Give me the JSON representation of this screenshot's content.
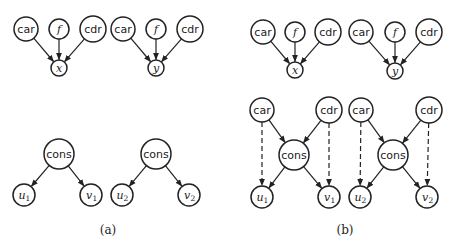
{
  "figure": {
    "panels": [
      {
        "id": "a",
        "caption": "(a)",
        "caption_pos": [
          108,
          234
        ],
        "nodes": [
          {
            "id": "a_car1",
            "label": "car",
            "style": "sans",
            "x": 26,
            "y": 29,
            "r": 12
          },
          {
            "id": "a_f1",
            "label": "f",
            "style": "math",
            "x": 59,
            "y": 29,
            "r": 10
          },
          {
            "id": "a_cdr1",
            "label": "cdr",
            "style": "sans",
            "x": 93,
            "y": 29,
            "r": 13
          },
          {
            "id": "a_x",
            "label": "x",
            "style": "math",
            "x": 59,
            "y": 68,
            "r": 8
          },
          {
            "id": "a_car2",
            "label": "car",
            "style": "sans",
            "x": 123,
            "y": 29,
            "r": 12
          },
          {
            "id": "a_f2",
            "label": "f",
            "style": "math",
            "x": 156,
            "y": 29,
            "r": 10
          },
          {
            "id": "a_cdr2",
            "label": "cdr",
            "style": "sans",
            "x": 190,
            "y": 29,
            "r": 13
          },
          {
            "id": "a_y",
            "label": "y",
            "style": "math",
            "x": 156,
            "y": 68,
            "r": 8
          },
          {
            "id": "a_cons1",
            "label": "cons",
            "style": "sans",
            "x": 59,
            "y": 154,
            "r": 15
          },
          {
            "id": "a_u1",
            "label": "u",
            "sub": "1",
            "style": "math",
            "x": 24,
            "y": 195,
            "r": 11
          },
          {
            "id": "a_v1",
            "label": "v",
            "sub": "1",
            "style": "math",
            "x": 91,
            "y": 195,
            "r": 11
          },
          {
            "id": "a_cons2",
            "label": "cons",
            "style": "sans",
            "x": 156,
            "y": 154,
            "r": 15
          },
          {
            "id": "a_u2",
            "label": "u",
            "sub": "2",
            "style": "math",
            "x": 122,
            "y": 195,
            "r": 11
          },
          {
            "id": "a_v2",
            "label": "v",
            "sub": "2",
            "style": "math",
            "x": 189,
            "y": 195,
            "r": 11
          }
        ],
        "edges": [
          {
            "from": "a_car1",
            "to": "a_x",
            "style": "solid"
          },
          {
            "from": "a_f1",
            "to": "a_x",
            "style": "solid"
          },
          {
            "from": "a_cdr1",
            "to": "a_x",
            "style": "solid"
          },
          {
            "from": "a_car2",
            "to": "a_y",
            "style": "solid"
          },
          {
            "from": "a_f2",
            "to": "a_y",
            "style": "solid"
          },
          {
            "from": "a_cdr2",
            "to": "a_y",
            "style": "solid"
          },
          {
            "from": "a_cons1",
            "to": "a_u1",
            "style": "solid"
          },
          {
            "from": "a_cons1",
            "to": "a_v1",
            "style": "solid"
          },
          {
            "from": "a_cons2",
            "to": "a_u2",
            "style": "solid"
          },
          {
            "from": "a_cons2",
            "to": "a_v2",
            "style": "solid"
          }
        ]
      },
      {
        "id": "b",
        "caption": "(b)",
        "caption_pos": [
          345,
          234
        ],
        "nodes": [
          {
            "id": "b_car1",
            "label": "car",
            "style": "sans",
            "x": 263,
            "y": 32,
            "r": 12
          },
          {
            "id": "b_f1",
            "label": "f",
            "style": "math",
            "x": 295,
            "y": 32,
            "r": 10
          },
          {
            "id": "b_cdr1",
            "label": "cdr",
            "style": "sans",
            "x": 328,
            "y": 32,
            "r": 13
          },
          {
            "id": "b_x",
            "label": "x",
            "style": "math",
            "x": 295,
            "y": 70,
            "r": 8
          },
          {
            "id": "b_car2",
            "label": "car",
            "style": "sans",
            "x": 361,
            "y": 32,
            "r": 12
          },
          {
            "id": "b_f2",
            "label": "f",
            "style": "math",
            "x": 395,
            "y": 32,
            "r": 10
          },
          {
            "id": "b_cdr2",
            "label": "cdr",
            "style": "sans",
            "x": 429,
            "y": 32,
            "r": 13
          },
          {
            "id": "b_y",
            "label": "y",
            "style": "math",
            "x": 395,
            "y": 71,
            "r": 8
          },
          {
            "id": "b_car3",
            "label": "car",
            "style": "sans",
            "x": 262,
            "y": 110,
            "r": 12
          },
          {
            "id": "b_cdr3",
            "label": "cdr",
            "style": "sans",
            "x": 329,
            "y": 110,
            "r": 13
          },
          {
            "id": "b_cons1",
            "label": "cons",
            "style": "sans",
            "x": 294,
            "y": 155,
            "r": 15
          },
          {
            "id": "b_u1",
            "label": "u",
            "sub": "1",
            "style": "math",
            "x": 262,
            "y": 197,
            "r": 11
          },
          {
            "id": "b_v1",
            "label": "v",
            "sub": "1",
            "style": "math",
            "x": 329,
            "y": 197,
            "r": 11
          },
          {
            "id": "b_car4",
            "label": "car",
            "style": "sans",
            "x": 361,
            "y": 110,
            "r": 12
          },
          {
            "id": "b_cdr4",
            "label": "cdr",
            "style": "sans",
            "x": 429,
            "y": 110,
            "r": 13
          },
          {
            "id": "b_cons2",
            "label": "cons",
            "style": "sans",
            "x": 393,
            "y": 155,
            "r": 15
          },
          {
            "id": "b_u2",
            "label": "u",
            "sub": "2",
            "style": "math",
            "x": 360,
            "y": 197,
            "r": 11
          },
          {
            "id": "b_v2",
            "label": "v",
            "sub": "2",
            "style": "math",
            "x": 427,
            "y": 197,
            "r": 11
          }
        ],
        "edges": [
          {
            "from": "b_car1",
            "to": "b_x",
            "style": "solid"
          },
          {
            "from": "b_f1",
            "to": "b_x",
            "style": "solid"
          },
          {
            "from": "b_cdr1",
            "to": "b_x",
            "style": "solid"
          },
          {
            "from": "b_car2",
            "to": "b_y",
            "style": "solid"
          },
          {
            "from": "b_f2",
            "to": "b_y",
            "style": "solid"
          },
          {
            "from": "b_cdr2",
            "to": "b_y",
            "style": "solid"
          },
          {
            "from": "b_car3",
            "to": "b_cons1",
            "style": "solid"
          },
          {
            "from": "b_cdr3",
            "to": "b_cons1",
            "style": "solid"
          },
          {
            "from": "b_cons1",
            "to": "b_u1",
            "style": "solid"
          },
          {
            "from": "b_cons1",
            "to": "b_v1",
            "style": "solid"
          },
          {
            "from": "b_car3",
            "to": "b_u1",
            "style": "dashed"
          },
          {
            "from": "b_cdr3",
            "to": "b_v1",
            "style": "dashed"
          },
          {
            "from": "b_car4",
            "to": "b_cons2",
            "style": "solid"
          },
          {
            "from": "b_cdr4",
            "to": "b_cons2",
            "style": "solid"
          },
          {
            "from": "b_cons2",
            "to": "b_u2",
            "style": "solid"
          },
          {
            "from": "b_cons2",
            "to": "b_v2",
            "style": "solid"
          },
          {
            "from": "b_car4",
            "to": "b_u2",
            "style": "dashed"
          },
          {
            "from": "b_cdr4",
            "to": "b_v2",
            "style": "dashed"
          }
        ]
      }
    ]
  }
}
